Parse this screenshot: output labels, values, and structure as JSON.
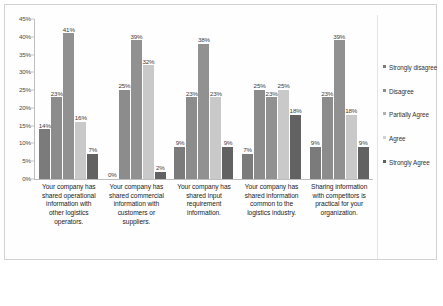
{
  "chart_data": {
    "type": "bar",
    "title": "",
    "xlabel": "",
    "ylabel": "",
    "ylim": [
      0,
      45
    ],
    "grid": false,
    "legend_position": "right",
    "y_ticks": [
      "0%",
      "5%",
      "10%",
      "15%",
      "20%",
      "25%",
      "30%",
      "35%",
      "40%",
      "45%"
    ],
    "y_tick_values": [
      0,
      5,
      10,
      15,
      20,
      25,
      30,
      35,
      40,
      45
    ],
    "categories": [
      "Your company has shared operational information with other logistics operators.",
      "Your company has shared commercial information with customers or suppliers.",
      "Your company has shared input requirement information.",
      "Your company has shared information common to the logistics industry.",
      "Sharing information with competitors is practical for your organization."
    ],
    "series": [
      {
        "name": "Strongly disagree",
        "color": "#7b7b7b",
        "values": [
          14,
          0,
          9,
          7,
          9
        ]
      },
      {
        "name": "Disagree",
        "color": "#8c8c8c",
        "values": [
          23,
          25,
          23,
          25,
          23
        ]
      },
      {
        "name": "Partially Agree",
        "color": "#919191",
        "values": [
          41,
          39,
          38,
          23,
          39
        ]
      },
      {
        "name": "Agree",
        "color": "#c9c9c9",
        "values": [
          16,
          32,
          23,
          25,
          18
        ]
      },
      {
        "name": "Strongly Agree",
        "color": "#626262",
        "values": [
          7,
          2,
          9,
          18,
          9
        ]
      }
    ],
    "data_labels": [
      [
        "14%",
        "23%",
        "41%",
        "16%",
        "7%"
      ],
      [
        "0%",
        "25%",
        "39%",
        "32%",
        "2%"
      ],
      [
        "9%",
        "23%",
        "38%",
        "23%",
        "9%"
      ],
      [
        "7%",
        "25%",
        "23%",
        "25%",
        "18%"
      ],
      [
        "9%",
        "23%",
        "39%",
        "18%",
        "9%"
      ]
    ]
  },
  "legend": {
    "items": [
      {
        "label": "Strongly disagree",
        "color": "#7b7b7b"
      },
      {
        "label": "Disagree",
        "color": "#8c8c8c"
      },
      {
        "label": "Partially Agree",
        "color": "#b0b0b0"
      },
      {
        "label": "Agree",
        "color": "#d2d2d2"
      },
      {
        "label": "Strongly Agree",
        "color": "#5e5e5e"
      }
    ]
  }
}
